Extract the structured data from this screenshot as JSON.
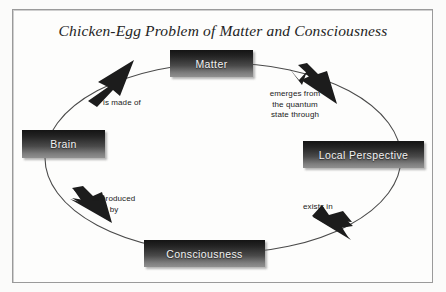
{
  "diagram": {
    "title": "Chicken-Egg Problem of Matter and Consciousness",
    "type": "cycle-diagram",
    "nodes": [
      {
        "id": "matter",
        "label": "Matter"
      },
      {
        "id": "local-perspective",
        "label": "Local Perspective"
      },
      {
        "id": "consciousness",
        "label": "Consciousness"
      },
      {
        "id": "brain",
        "label": "Brain"
      }
    ],
    "edges": [
      {
        "from": "matter",
        "to": "local-perspective",
        "label": "emerges from\nthe quantum\nstate through"
      },
      {
        "from": "local-perspective",
        "to": "consciousness",
        "label": "exists in"
      },
      {
        "from": "consciousness",
        "to": "brain",
        "label": "is produced\nby"
      },
      {
        "from": "brain",
        "to": "matter",
        "label": "is made of"
      }
    ],
    "colors": {
      "node_top": "#141414",
      "node_bottom": "#909090",
      "node_text": "#f2f2f2",
      "frame_border": "#9a9a9a",
      "background": "#fbfbfa",
      "ellipse_stroke": "#4a4a4a",
      "arrow_fill": "#1c1c1c",
      "title_text": "#232323"
    }
  }
}
